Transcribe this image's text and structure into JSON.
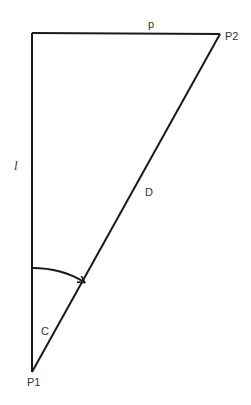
{
  "diagram": {
    "type": "right-triangle",
    "colors": {
      "stroke": "#1a1a1a",
      "label": "#333333",
      "background": "#ffffff"
    },
    "points": {
      "corner": {
        "x": 32,
        "y": 33
      },
      "P1": {
        "x": 32,
        "y": 372
      },
      "P2": {
        "x": 220,
        "y": 34
      }
    },
    "labels": {
      "top_side": "p",
      "left_side": "l",
      "hypotenuse": "D",
      "angle": "C",
      "point1": "P1",
      "point2": "P2"
    },
    "edges": [
      {
        "name": "p",
        "from": "corner",
        "to": "P2"
      },
      {
        "name": "l",
        "from": "corner",
        "to": "P1"
      },
      {
        "name": "D",
        "from": "P1",
        "to": "P2"
      }
    ],
    "arc": {
      "from_side": "l",
      "to_side": "D",
      "at": "P1",
      "has_arrow": true
    }
  }
}
